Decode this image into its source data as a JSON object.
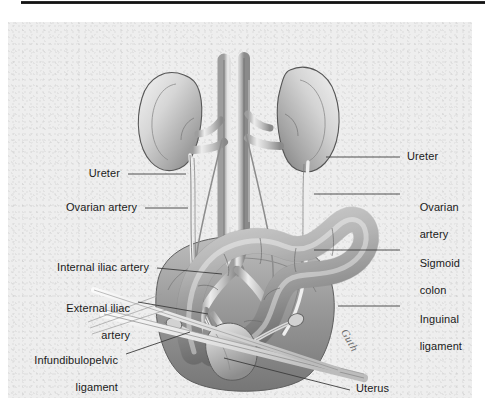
{
  "figure": {
    "type": "medical-illustration",
    "style": "graphite pencil rendering",
    "background_color": "#eeeeee",
    "rule_color": "#111111",
    "label_color": "#1a1a1a",
    "leader_line_color": "#3c3c3c",
    "artist_signature": "Guth"
  },
  "labels": {
    "left": [
      {
        "id": "ureter-left",
        "text": "Ureter"
      },
      {
        "id": "ovarian-artery-left",
        "text": "Ovarian artery"
      },
      {
        "id": "internal-iliac-artery",
        "text": "Internal iliac artery"
      },
      {
        "id": "external-iliac-artery",
        "line1": "External iliac",
        "line2": "artery"
      },
      {
        "id": "infundibulopelvic-ligament",
        "line1": "Infundibulopelvic",
        "line2": "ligament"
      }
    ],
    "right": [
      {
        "id": "ureter-right",
        "text": "Ureter"
      },
      {
        "id": "ovarian-artery-right",
        "line1": "Ovarian",
        "line2": "artery"
      },
      {
        "id": "sigmoid-colon",
        "line1": "Sigmoid",
        "line2": "colon"
      },
      {
        "id": "inguinal-ligament",
        "line1": "Inguinal",
        "line2": "ligament"
      }
    ],
    "bottom": [
      {
        "id": "uterus",
        "text": "Uterus"
      }
    ]
  },
  "structures": [
    "left kidney",
    "right kidney",
    "abdominal aorta",
    "inferior vena cava",
    "renal arteries",
    "renal veins",
    "ureters",
    "ovarian arteries",
    "common iliac arteries",
    "internal iliac artery",
    "external iliac artery",
    "sigmoid colon",
    "uterus",
    "fallopian tubes",
    "ovaries",
    "infundibulopelvic ligament",
    "inguinal ligament",
    "round ligament"
  ]
}
